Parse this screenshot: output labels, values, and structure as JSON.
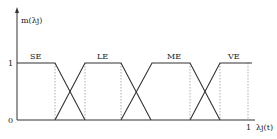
{
  "diagram": {
    "y_axis_label": "m(λj)",
    "x_axis_label": "λj(t)",
    "y_ticks": [
      "1",
      "0"
    ],
    "x_tick": "1",
    "sets": [
      {
        "label": "SE",
        "points": [
          [
            17,
            63
          ],
          [
            55,
            63
          ],
          [
            85,
            120
          ]
        ]
      },
      {
        "label": "LE",
        "points": [
          [
            55,
            120
          ],
          [
            85,
            63
          ],
          [
            121,
            63
          ],
          [
            151,
            120
          ]
        ]
      },
      {
        "label": "ME",
        "points": [
          [
            121,
            120
          ],
          [
            152,
            63
          ],
          [
            190,
            63
          ],
          [
            220,
            120
          ]
        ]
      },
      {
        "label": "VE",
        "points": [
          [
            190,
            120
          ],
          [
            220,
            63
          ],
          [
            252,
            63
          ]
        ]
      }
    ],
    "dotted_lines_x": [
      55,
      85,
      121,
      190,
      220,
      248
    ]
  }
}
